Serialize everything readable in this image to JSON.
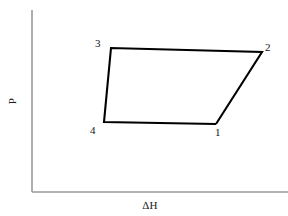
{
  "figure": {
    "background_color": "#ffffff",
    "axis_color": "#9a9a9a",
    "curve_color": "#000000",
    "label_color": "#111111",
    "top_clipped_fragment": ""
  },
  "axes": {
    "y_label": "P",
    "x_label": "ΔH",
    "y_axis": {
      "x": 32,
      "y_top": 10,
      "y_bottom": 192
    },
    "x_axis": {
      "y": 192,
      "x_left": 32,
      "x_right": 288
    },
    "ticks_visible": false,
    "tick_labels": []
  },
  "chart_data": {
    "type": "line",
    "title": "",
    "xlabel": "ΔH",
    "ylabel": "P",
    "closed_cycle": true,
    "grid": false,
    "legend": null,
    "point_labels": [
      "1",
      "2",
      "3",
      "4"
    ],
    "points": [
      {
        "label": "1",
        "x": 216,
        "y": 124,
        "label_x": 215,
        "label_y": 126
      },
      {
        "label": "2",
        "x": 262,
        "y": 52,
        "label_x": 265,
        "label_y": 41
      },
      {
        "label": "3",
        "x": 111,
        "y": 48,
        "label_x": 95,
        "label_y": 37
      },
      {
        "label": "4",
        "x": 104,
        "y": 122,
        "label_x": 90,
        "label_y": 124
      }
    ],
    "path_order": [
      "1",
      "2",
      "3",
      "4",
      "1"
    ],
    "polygon_points": "216,124 262,52 111,48 104,122 216,124"
  }
}
